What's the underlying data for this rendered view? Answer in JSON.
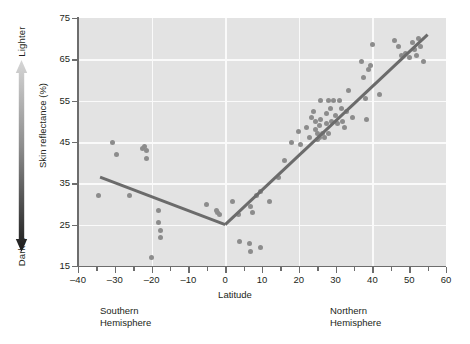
{
  "figure": {
    "y_axis": {
      "title": "Skin reflectance (%)",
      "ticks": [
        15,
        25,
        35,
        45,
        55,
        65,
        75
      ],
      "gradient_top_label": "Lighter",
      "gradient_bottom_label": "Darker",
      "gradient_top_color": "#d4d4d4",
      "gradient_bottom_color": "#1a1a1a"
    },
    "x_axis": {
      "title": "Latitude",
      "ticks": [
        -40,
        -30,
        -20,
        -10,
        0,
        10,
        20,
        30,
        40,
        50,
        60
      ],
      "minor_step": 5
    },
    "annotations": {
      "southern": "Southern\nHemisphere",
      "southern_line1": "Southern",
      "southern_line2": "Hemisphere",
      "northern_line1": "Northern",
      "northern_line2": "Hemisphere"
    },
    "colors": {
      "plot_background": "#e3e3e3",
      "gridline": "#fafafa",
      "point": "#8c8c8c",
      "regression_line": "#6b6b6b",
      "axis": "#6d6d6d",
      "text": "#231f20"
    }
  },
  "chart_data": {
    "type": "scatter",
    "title": "",
    "xlabel": "Latitude",
    "ylabel": "Skin reflectance (%)",
    "xlim": [
      -40,
      60
    ],
    "ylim": [
      15,
      75
    ],
    "xticks": [
      -40,
      -30,
      -20,
      -10,
      0,
      10,
      20,
      30,
      40,
      50,
      60
    ],
    "yticks": [
      15,
      25,
      35,
      45,
      55,
      65,
      75
    ],
    "grid": true,
    "grid_x_values": [
      -20,
      0,
      20,
      40
    ],
    "grid_y_values": [
      25,
      35,
      45,
      55,
      65
    ],
    "legend": null,
    "series": [
      {
        "name": "Populations",
        "marker": "circle",
        "color": "#8c8c8c",
        "points": [
          [
            -34.5,
            32.0
          ],
          [
            -30.5,
            44.8
          ],
          [
            -29.5,
            42.0
          ],
          [
            -26.0,
            32.0
          ],
          [
            -22.5,
            43.5
          ],
          [
            -22.0,
            44.0
          ],
          [
            -21.5,
            43.0
          ],
          [
            -21.5,
            41.0
          ],
          [
            -20.0,
            17.0
          ],
          [
            -18.0,
            28.5
          ],
          [
            -18.0,
            25.5
          ],
          [
            -17.5,
            23.5
          ],
          [
            -17.5,
            22.0
          ],
          [
            -5.0,
            30.0
          ],
          [
            -2.5,
            28.5
          ],
          [
            -2.0,
            28.0
          ],
          [
            -1.5,
            27.5
          ],
          [
            2.0,
            30.5
          ],
          [
            3.5,
            27.5
          ],
          [
            4.0,
            21.0
          ],
          [
            6.5,
            20.5
          ],
          [
            7.0,
            18.5
          ],
          [
            7.0,
            29.5
          ],
          [
            7.5,
            28.0
          ],
          [
            8.5,
            32.0
          ],
          [
            9.5,
            33.0
          ],
          [
            9.5,
            19.5
          ],
          [
            12.0,
            30.5
          ],
          [
            14.5,
            36.5
          ],
          [
            16.0,
            40.5
          ],
          [
            18.0,
            45.0
          ],
          [
            20.0,
            47.5
          ],
          [
            20.5,
            44.5
          ],
          [
            22.0,
            48.5
          ],
          [
            23.0,
            46.0
          ],
          [
            23.5,
            51.0
          ],
          [
            24.0,
            52.5
          ],
          [
            24.5,
            50.0
          ],
          [
            24.5,
            48.0
          ],
          [
            25.0,
            47.0
          ],
          [
            25.0,
            45.5
          ],
          [
            25.5,
            49.0
          ],
          [
            25.5,
            46.0
          ],
          [
            26.0,
            55.0
          ],
          [
            26.0,
            50.5
          ],
          [
            26.5,
            47.0
          ],
          [
            27.0,
            46.0
          ],
          [
            27.5,
            52.0
          ],
          [
            27.5,
            49.5
          ],
          [
            28.0,
            55.0
          ],
          [
            28.0,
            47.0
          ],
          [
            28.5,
            53.0
          ],
          [
            29.0,
            50.0
          ],
          [
            29.5,
            55.0
          ],
          [
            30.0,
            51.5
          ],
          [
            30.5,
            49.5
          ],
          [
            31.0,
            55.0
          ],
          [
            31.5,
            53.0
          ],
          [
            32.0,
            50.0
          ],
          [
            32.5,
            48.5
          ],
          [
            33.0,
            52.5
          ],
          [
            33.5,
            57.5
          ],
          [
            34.5,
            51.0
          ],
          [
            37.0,
            64.5
          ],
          [
            37.5,
            60.5
          ],
          [
            38.0,
            55.5
          ],
          [
            38.5,
            50.5
          ],
          [
            39.0,
            62.5
          ],
          [
            39.5,
            63.5
          ],
          [
            40.0,
            68.5
          ],
          [
            42.0,
            56.5
          ],
          [
            46.0,
            69.5
          ],
          [
            47.0,
            68.0
          ],
          [
            48.0,
            66.0
          ],
          [
            49.0,
            66.5
          ],
          [
            50.0,
            65.5
          ],
          [
            51.0,
            69.0
          ],
          [
            51.5,
            67.5
          ],
          [
            52.0,
            66.0
          ],
          [
            52.5,
            70.0
          ],
          [
            53.0,
            68.0
          ],
          [
            54.0,
            64.5
          ]
        ]
      }
    ],
    "fit_lines": [
      {
        "name": "southern-trend",
        "color": "#6b6b6b",
        "points": [
          [
            -34.0,
            36.5
          ],
          [
            0.0,
            25.0
          ]
        ]
      },
      {
        "name": "northern-trend",
        "color": "#6b6b6b",
        "points": [
          [
            0.0,
            25.0
          ],
          [
            55.0,
            71.0
          ]
        ]
      }
    ]
  }
}
